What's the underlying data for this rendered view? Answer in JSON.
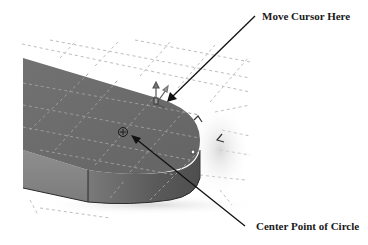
{
  "figure": {
    "callouts": [
      {
        "id": "move-cursor",
        "text": "Move Cursor Here"
      },
      {
        "id": "center-point",
        "text": "Center Point of Circle"
      }
    ],
    "colors": {
      "background": "#ffffff",
      "body_top": "#6e6e6e",
      "body_side_left": "#8a8a8a",
      "body_side_front": "#5e5e5e",
      "grid": "#b8b8b8",
      "arrow": "#111111",
      "text": "#1a1a1a"
    },
    "icons": [
      "center-point-marker-icon",
      "triad-cursor-icon",
      "inference-marker-icon"
    ]
  }
}
